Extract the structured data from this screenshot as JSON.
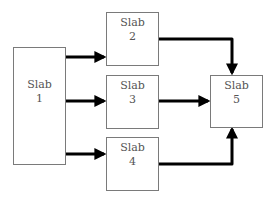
{
  "diagram": {
    "type": "flow",
    "colors": {
      "box_border": "#7a7a7a",
      "text": "#555555",
      "arrow": "#000000",
      "background": "#ffffff"
    },
    "nodes": [
      {
        "id": "slab1",
        "title": "Slab",
        "number": "1"
      },
      {
        "id": "slab2",
        "title": "Slab",
        "number": "2"
      },
      {
        "id": "slab3",
        "title": "Slab",
        "number": "3"
      },
      {
        "id": "slab4",
        "title": "Slab",
        "number": "4"
      },
      {
        "id": "slab5",
        "title": "Slab",
        "number": "5"
      }
    ],
    "edges": [
      {
        "from": "slab1",
        "to": "slab2"
      },
      {
        "from": "slab1",
        "to": "slab3"
      },
      {
        "from": "slab1",
        "to": "slab4"
      },
      {
        "from": "slab2",
        "to": "slab5"
      },
      {
        "from": "slab3",
        "to": "slab5"
      },
      {
        "from": "slab4",
        "to": "slab5"
      }
    ]
  }
}
